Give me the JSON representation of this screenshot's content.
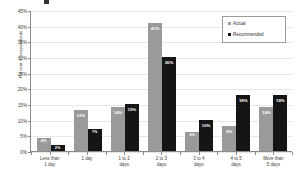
{
  "chart_data": {
    "type": "bar",
    "title": "",
    "xlabel": "",
    "ylabel": "Percent of respondents",
    "ylim": [
      0,
      45
    ],
    "ytick_labels": [
      "0%",
      "5%",
      "10%",
      "15%",
      "20%",
      "25%",
      "30%",
      "35%",
      "40%",
      "45%"
    ],
    "ytick_values": [
      0,
      5,
      10,
      15,
      20,
      25,
      30,
      35,
      40,
      45
    ],
    "grid": true,
    "legend_position": "top-right",
    "categories": [
      "Less than 1 day",
      "1 day",
      "1 to 2 days",
      "2 to 3 days",
      "3 to 4 days",
      "4 to 5 days",
      "More than 5 days"
    ],
    "category_lines": [
      [
        "Less than",
        "1 day"
      ],
      [
        "1 day",
        ""
      ],
      [
        "1 to 2",
        "days"
      ],
      [
        "2 to 3",
        "days"
      ],
      [
        "3 to 4",
        "days"
      ],
      [
        "4 to 5",
        "days"
      ],
      [
        "More than",
        "5 days"
      ]
    ],
    "series": [
      {
        "name": "Actual",
        "color": "#9a9a9a",
        "values": [
          4,
          13,
          14,
          41,
          6,
          8,
          14
        ],
        "labels": [
          "4%",
          "13%",
          "14%",
          "41%",
          "6%",
          "8%",
          "14%"
        ]
      },
      {
        "name": "Recommended",
        "color": "#151515",
        "values": [
          2,
          7,
          15,
          30,
          10,
          18,
          18
        ],
        "labels": [
          "2%",
          "7%",
          "15%",
          "30%",
          "10%",
          "18%",
          "18%"
        ]
      }
    ]
  },
  "legend": {
    "items": [
      {
        "label": "Actual",
        "color": "#9a9a9a"
      },
      {
        "label": "Recommended",
        "color": "#151515"
      }
    ]
  },
  "axes": {
    "y_title": "Percent of respondents"
  }
}
